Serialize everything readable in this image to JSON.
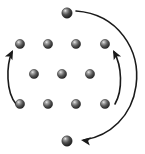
{
  "figure": {
    "background_color": "#ffffff",
    "width": 145,
    "height": 154
  },
  "style": {
    "sphere_fill_dark": "#3b3b3b",
    "sphere_fill_mid": "#6e6e6e",
    "sphere_highlight": "#d6d6d6",
    "sphere_edge": "#262626",
    "arrow_color": "#1a1a1a",
    "arrow_width": 1.6,
    "sphere_radius": 4.6,
    "sphere_radius_large": 5.2
  },
  "spheres": [
    {
      "id": "top-isolated",
      "label": "top isolated sphere",
      "cx": 67,
      "cy": 13,
      "r": 5.2,
      "row": "isolated-top"
    },
    {
      "id": "r1c1",
      "label": "row1 sphere 1",
      "cx": 20,
      "cy": 44,
      "r": 4.6,
      "row": "row-1"
    },
    {
      "id": "r1c2",
      "label": "row1 sphere 2",
      "cx": 48,
      "cy": 44,
      "r": 4.6,
      "row": "row-1"
    },
    {
      "id": "r1c3",
      "label": "row1 sphere 3",
      "cx": 76,
      "cy": 44,
      "r": 4.6,
      "row": "row-1"
    },
    {
      "id": "r1c4",
      "label": "row1 sphere 4",
      "cx": 105,
      "cy": 44,
      "r": 4.6,
      "row": "row-1"
    },
    {
      "id": "r2c1",
      "label": "row2 sphere 1",
      "cx": 34,
      "cy": 74,
      "r": 4.6,
      "row": "row-2"
    },
    {
      "id": "r2c2",
      "label": "row2 sphere 2",
      "cx": 62,
      "cy": 74,
      "r": 4.6,
      "row": "row-2"
    },
    {
      "id": "r2c3",
      "label": "row2 sphere 3",
      "cx": 90,
      "cy": 74,
      "r": 4.6,
      "row": "row-2"
    },
    {
      "id": "r3c1",
      "label": "row3 sphere 1",
      "cx": 20,
      "cy": 104,
      "r": 4.6,
      "row": "row-3"
    },
    {
      "id": "r3c2",
      "label": "row3 sphere 2",
      "cx": 48,
      "cy": 104,
      "r": 4.6,
      "row": "row-3"
    },
    {
      "id": "r3c3",
      "label": "row3 sphere 3",
      "cx": 76,
      "cy": 104,
      "r": 4.6,
      "row": "row-3"
    },
    {
      "id": "r3c4",
      "label": "row3 sphere 4",
      "cx": 105,
      "cy": 104,
      "r": 4.6,
      "row": "row-3"
    },
    {
      "id": "bottom-isolated",
      "label": "bottom isolated sphere",
      "cx": 67,
      "cy": 141,
      "r": 5.2,
      "row": "isolated-bottom"
    }
  ],
  "arrows": [
    {
      "id": "arrow-left",
      "label": "left curved arrow pointing up",
      "path": "M 16 104 C 6 92 6 66 12 52",
      "head": {
        "x": 13,
        "y": 50,
        "angle": -63
      }
    },
    {
      "id": "arrow-right-inner",
      "label": "right inner curved arrow pointing up",
      "path": "M 115 104 C 123 90 122 66 114 52",
      "head": {
        "x": 113,
        "y": 50,
        "angle": -118
      }
    },
    {
      "id": "arrow-outer-sweep",
      "label": "large outer curved arrow sweeping right and down, pointing left",
      "path": "M 76 11 C 118 14 141 50 136 86 C 132 116 110 136 84 140",
      "head": {
        "x": 81,
        "y": 140,
        "angle": 188
      }
    }
  ]
}
